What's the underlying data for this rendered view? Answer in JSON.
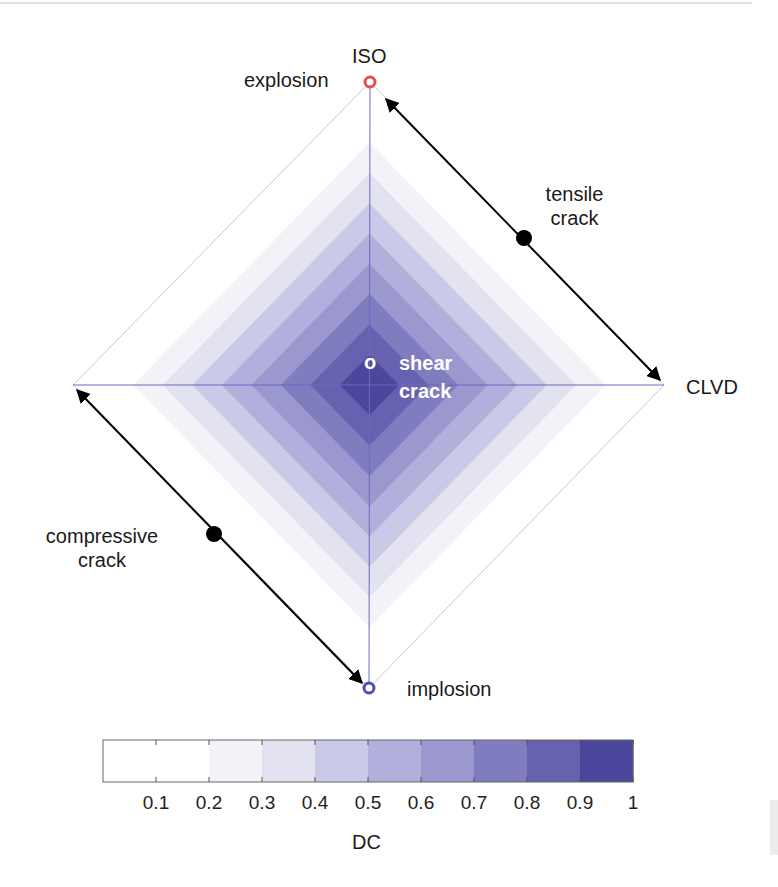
{
  "diagram": {
    "type": "source-type diamond (DC decomposition)",
    "vertices": {
      "top": {
        "label": "ISO",
        "marker_label": "explosion",
        "marker_color": "#e05050"
      },
      "right": {
        "label": "CLVD"
      },
      "bottom": {
        "marker_label": "implosion",
        "marker_color": "#4a4fb0"
      },
      "center": {
        "marker": "o",
        "label_line1": "shear",
        "label_line2": "crack"
      }
    },
    "arrows": [
      {
        "label_line1": "tensile",
        "label_line2": "crack",
        "from": "ISO",
        "to": "CLVD"
      },
      {
        "label_line1": "compressive",
        "label_line2": "crack",
        "from": "left-vertex",
        "to": "implosion"
      }
    ],
    "band_colors": [
      "#ffffff",
      "#ffffff",
      "#f2f1f8",
      "#e0dff0",
      "#c9c7e8",
      "#b3b0df",
      "#9b98d2",
      "#8380c4",
      "#6d69b4",
      "#5551a5",
      "#454197"
    ]
  },
  "colorbar": {
    "label": "DC",
    "ticks": [
      "0.1",
      "0.2",
      "0.3",
      "0.4",
      "0.5",
      "0.6",
      "0.7",
      "0.8",
      "0.9",
      "1"
    ],
    "segments": [
      "#ffffff",
      "#ffffff",
      "#f3f2f8",
      "#e3e2f0",
      "#cbc9e8",
      "#b2afdd",
      "#9b98d0",
      "#7f7cc0",
      "#6662b0",
      "#4b479c"
    ]
  },
  "chart_data": {
    "type": "heatmap",
    "title": "",
    "xlabel": "",
    "ylabel": "",
    "colorbar_label": "DC",
    "colorbar_ticks": [
      0.1,
      0.2,
      0.3,
      0.4,
      0.5,
      0.6,
      0.7,
      0.8,
      0.9,
      1
    ],
    "colorbar_range": [
      0,
      1
    ],
    "levels": 10,
    "annotations": [
      "ISO",
      "explosion",
      "tensile crack",
      "CLVD",
      "shear crack",
      "compressive crack",
      "implosion"
    ]
  }
}
